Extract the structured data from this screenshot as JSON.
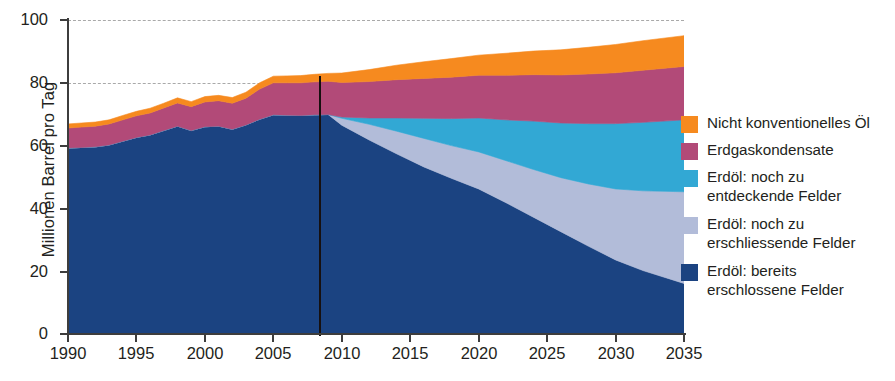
{
  "chart_data": {
    "type": "area",
    "stacked": true,
    "title": "",
    "xlabel": "",
    "ylabel": "Millionen Barrel pro Tag",
    "xlim": [
      1990,
      2035
    ],
    "ylim": [
      0,
      100
    ],
    "xticks": [
      1990,
      1995,
      2000,
      2005,
      2010,
      2015,
      2020,
      2025,
      2030,
      2035
    ],
    "yticks": [
      0,
      20,
      40,
      60,
      80,
      100
    ],
    "gridlines": [
      80,
      100
    ],
    "grid": "horizontal-dashed",
    "legend_position": "right",
    "divider_year": 2009,
    "x": [
      1990,
      1991,
      1992,
      1993,
      1994,
      1995,
      1996,
      1997,
      1998,
      1999,
      2000,
      2001,
      2002,
      2003,
      2004,
      2005,
      2006,
      2007,
      2008,
      2009,
      2010,
      2012,
      2014,
      2016,
      2018,
      2020,
      2022,
      2024,
      2026,
      2028,
      2030,
      2032,
      2035
    ],
    "series": [
      {
        "name": "Erdöl: bereits erschlossene Felder",
        "color": "#1b4381",
        "values": [
          59.2,
          59.4,
          59.6,
          60.2,
          61.4,
          62.6,
          63.4,
          64.8,
          66.2,
          64.8,
          66.0,
          66.2,
          65.2,
          66.6,
          68.4,
          69.8,
          69.7,
          69.6,
          69.8,
          69.9,
          66.5,
          61.8,
          57.4,
          53.2,
          49.6,
          46.2,
          41.8,
          37.2,
          32.6,
          28.0,
          23.6,
          20.2,
          16.1
        ]
      },
      {
        "name": "Erdöl: noch zu erschliessende Felder",
        "color": "#b2bcd9",
        "values": [
          0,
          0,
          0,
          0,
          0,
          0,
          0,
          0,
          0,
          0,
          0,
          0,
          0,
          0,
          0,
          0,
          0,
          0,
          0,
          0,
          2.2,
          5.0,
          7.2,
          9.1,
          10.4,
          11.8,
          13.4,
          15.2,
          17.2,
          19.8,
          22.6,
          25.4,
          29.2
        ]
      },
      {
        "name": "Erdöl: noch zu entdeckende Felder",
        "color": "#32a8d4",
        "values": [
          0,
          0,
          0,
          0,
          0,
          0,
          0,
          0,
          0,
          0,
          0,
          0,
          0,
          0,
          0,
          0,
          0,
          0,
          0,
          0,
          0.4,
          2.0,
          4.2,
          6.4,
          8.6,
          10.8,
          13.0,
          15.4,
          17.4,
          19.2,
          20.8,
          21.8,
          22.9
        ]
      },
      {
        "name": "Erdgaskondensate",
        "color": "#b24a78",
        "values": [
          6.4,
          6.5,
          6.6,
          6.7,
          6.8,
          6.9,
          7.0,
          7.2,
          7.4,
          7.6,
          7.9,
          8.1,
          8.3,
          8.5,
          9.6,
          10.2,
          10.3,
          10.4,
          10.5,
          10.6,
          11.0,
          11.6,
          12.2,
          12.7,
          13.2,
          13.6,
          14.2,
          14.8,
          15.3,
          15.8,
          16.2,
          16.6,
          17.0
        ]
      },
      {
        "name": "Nicht konventionelles Öl",
        "color": "#f68a1f",
        "values": [
          1.3,
          1.3,
          1.3,
          1.3,
          1.4,
          1.4,
          1.5,
          1.5,
          1.6,
          1.6,
          1.7,
          1.7,
          1.8,
          1.9,
          2.0,
          2.1,
          2.2,
          2.3,
          2.4,
          2.5,
          3.0,
          3.8,
          4.6,
          5.3,
          5.9,
          6.4,
          7.0,
          7.5,
          8.0,
          8.5,
          9.0,
          9.4,
          9.8
        ]
      }
    ]
  },
  "axes": {
    "ylabel": "Millionen Barrel pro Tag",
    "ytick_labels": [
      "0",
      "20",
      "40",
      "60",
      "80",
      "100"
    ],
    "xtick_labels": [
      "1990",
      "1995",
      "2000",
      "2005",
      "2010",
      "2015",
      "2020",
      "2025",
      "2030",
      "2035"
    ]
  },
  "legend": {
    "items": [
      {
        "label_line1": "Nicht konventionelles Öl",
        "label_line2": "",
        "color": "#f68a1f"
      },
      {
        "label_line1": "Erdgaskondensate",
        "label_line2": "",
        "color": "#b24a78"
      },
      {
        "label_line1": "Erdöl: noch zu",
        "label_line2": "entdeckende Felder",
        "color": "#32a8d4"
      },
      {
        "label_line1": "Erdöl: noch zu",
        "label_line2": "erschliessende Felder",
        "color": "#b2bcd9"
      },
      {
        "label_line1": "Erdöl: bereits",
        "label_line2": "erschlossene Felder",
        "color": "#1b4381"
      }
    ]
  },
  "colors": {
    "unconventional_oil": "#f68a1f",
    "gas_condensate": "#b24a78",
    "undiscovered_fields": "#32a8d4",
    "undeveloped_fields": "#b2bcd9",
    "developed_fields": "#1b4381",
    "axis": "#3d3d3d",
    "grid": "#a9a9a9",
    "divider": "#17100f",
    "text": "#231f20"
  }
}
